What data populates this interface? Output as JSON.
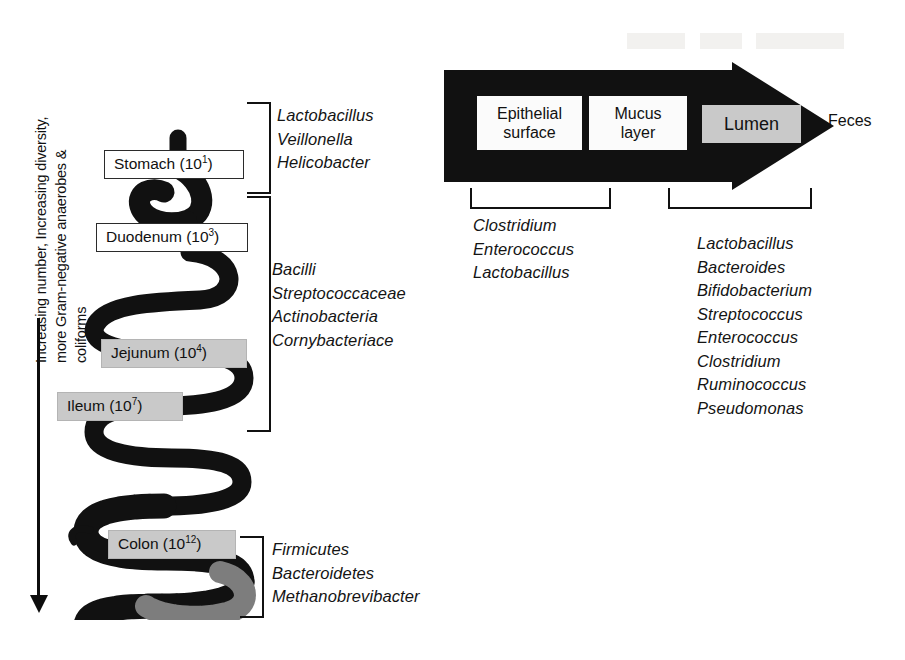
{
  "figure": {
    "left_panel": {
      "gradient_axis_label": "Increasing number, Increasing diversity,\nmore Gram-negative anaerobes &\ncoliforms",
      "organs": [
        {
          "name": "Stomach",
          "label": "Stomach (10",
          "exponent": "1",
          "suffix": ")",
          "fill": "white"
        },
        {
          "name": "Duodenum",
          "label": "Duodenum (10",
          "exponent": "3",
          "suffix": ")",
          "fill": "white"
        },
        {
          "name": "Jejunum",
          "label": "Jejunum (10",
          "exponent": "4",
          "suffix": ")",
          "fill": "gray"
        },
        {
          "name": "Ileum",
          "label": "Ileum (10",
          "exponent": "7",
          "suffix": ")",
          "fill": "gray"
        },
        {
          "name": "Colon",
          "label": "Colon (10",
          "exponent": "12",
          "suffix": ")",
          "fill": "gray"
        }
      ],
      "taxa_groups": [
        {
          "region": "stomach",
          "organisms": "Lactobacillus\nVeillonella\nHelicobacter"
        },
        {
          "region": "small-intestine",
          "organisms": "Bacilli\nStreptococcaceae\nActinobacteria\nCornybacteriace"
        },
        {
          "region": "colon",
          "organisms": "Firmicutes\nBacteroidetes\nMethanobrevibacter"
        }
      ]
    },
    "right_panel": {
      "epithelium_label": "Epithelium",
      "zones": [
        {
          "name": "epithelial-surface",
          "label": "Epithelial\nsurface",
          "fill": "white"
        },
        {
          "name": "mucus-layer",
          "label": "Mucus\nlayer",
          "fill": "white"
        },
        {
          "name": "lumen",
          "label": "Lumen",
          "fill": "gray"
        }
      ],
      "outflow_label": "Feces",
      "taxa_groups": [
        {
          "region": "mucosa",
          "organisms": "Clostridium\nEnterococcus\nLactobacillus"
        },
        {
          "region": "lumen",
          "organisms": "Lactobacillus\nBacteroides\nBifidobacterium\nStreptococcus\nEnterococcus\nClostridium\nRuminococcus\nPseudomonas"
        }
      ]
    },
    "colors": {
      "ink": "#111111",
      "gray_fill": "#c9c9c9",
      "tract_black": "#111111",
      "rectum_gray": "#7d7d7d",
      "white_fill": "#ffffff"
    }
  }
}
